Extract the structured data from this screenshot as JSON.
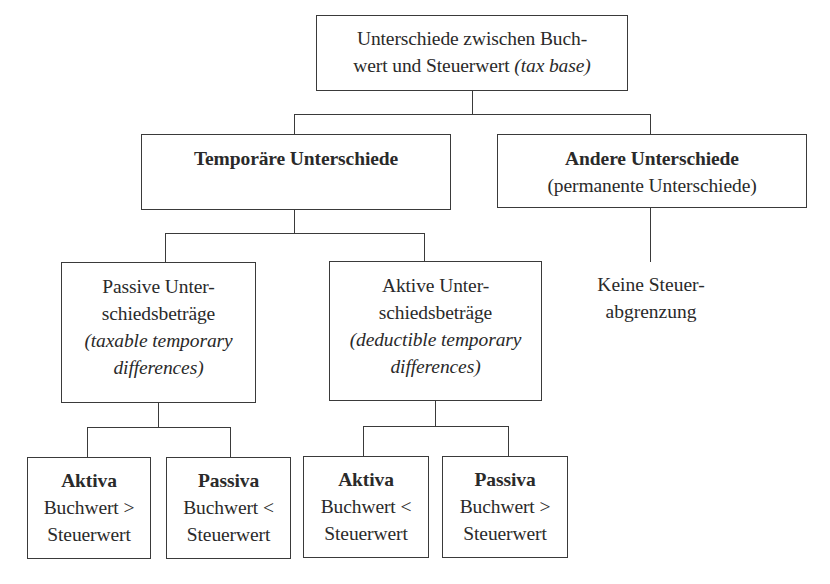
{
  "diagram": {
    "root": {
      "line1": "Unterschiede zwischen Buch-",
      "line2_normal": "wert und Steuerwert ",
      "line2_italic": "(tax base)"
    },
    "temporary": {
      "title": "Temporäre Unterschiede"
    },
    "other": {
      "title": "Andere Unterschiede",
      "subtitle": "(permanente Unterschiede)",
      "note_line1": "Keine Steuer-",
      "note_line2": "abgrenzung"
    },
    "passive": {
      "line1": "Passive Unter-",
      "line2": "schiedsbeträge",
      "line3": "(taxable temporary",
      "line4": "differences)"
    },
    "active": {
      "line1": "Aktive Unter-",
      "line2": "schiedsbeträge",
      "line3": "(deductible temporary",
      "line4": "differences)"
    },
    "leaves": [
      {
        "title": "Aktiva",
        "line1": "Buchwert >",
        "line2": "Steuerwert"
      },
      {
        "title": "Passiva",
        "line1": "Buchwert <",
        "line2": "Steuerwert"
      },
      {
        "title": "Aktiva",
        "line1": "Buchwert <",
        "line2": "Steuerwert"
      },
      {
        "title": "Passiva",
        "line1": "Buchwert >",
        "line2": "Steuerwert"
      }
    ]
  },
  "colors": {
    "line": "#3a3a3a",
    "text": "#2a2a2a",
    "background": "#ffffff"
  }
}
